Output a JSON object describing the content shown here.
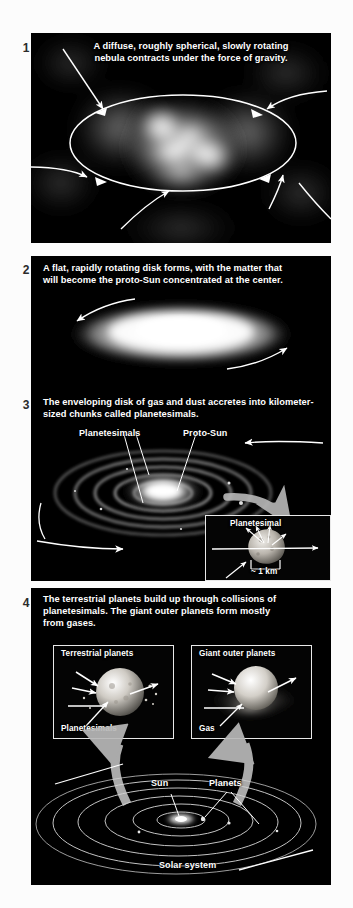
{
  "figure": {
    "background_color": "#fcfcfc",
    "plate_color": "#000000",
    "text_color": "#ffffff",
    "number_color": "#2b2b2b",
    "arrow_color": "#ffffff",
    "thick_arrow_color": "#b9b9b9"
  },
  "steps": [
    {
      "number": "1",
      "caption": "A diffuse, roughly spherical, slowly rotating\nnebula contracts under the force of gravity.",
      "scene": "contracting nebula with rotation ellipse and infalling arrows"
    },
    {
      "number": "2",
      "caption": "A flat, rapidly rotating disk forms, with the matter that\nwill become the proto-Sun concentrated at the center.",
      "scene": "flattened rapidly rotating bright disk"
    },
    {
      "number": "3",
      "caption": "The enveloping disk of gas and dust accretes into kilometer-\nsized chunks called planetesimals.",
      "scene": "ringed accretion disk with bright proto-Sun",
      "labels": [
        {
          "text": "Planetesimals",
          "name": "planetesimals-label"
        },
        {
          "text": "Proto-Sun",
          "name": "proto-sun-label"
        }
      ],
      "inset": {
        "title": "Planetesimal",
        "scale_label": "~ 1 km"
      }
    },
    {
      "number": "4",
      "caption": "The terrestrial planets build up through collisions of\nplanetesimals. The giant outer planets form mostly\nfrom gases.",
      "scene": "two detail insets above the solar system disk",
      "insets": [
        {
          "title": "Terrestrial planets",
          "sub_label": "Planetesimals"
        },
        {
          "title": "Giant outer planets",
          "sub_label": "Gas"
        }
      ],
      "solar_system": {
        "sun_label": "Sun",
        "planets_label": "Planets",
        "caption": "Solar system",
        "orbit_count": 6
      }
    }
  ]
}
